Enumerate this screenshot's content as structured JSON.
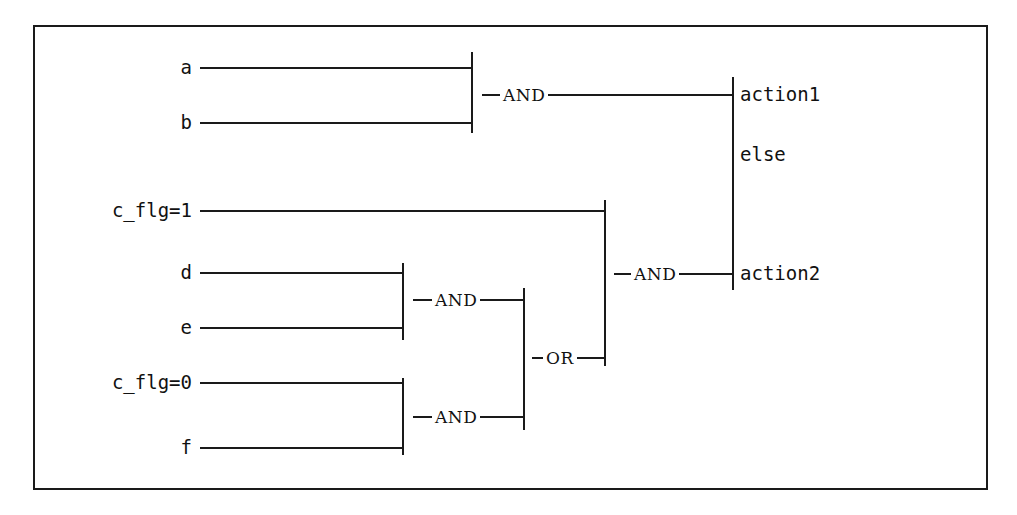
{
  "diagram": {
    "stroke_color": "#1a1a1a",
    "background_color": "#ffffff",
    "border": {
      "name": "diagram-frame",
      "x": 33,
      "y": 25,
      "width": 955,
      "height": 465,
      "thickness": 2
    },
    "inputs": [
      {
        "id": "a",
        "label": "a",
        "label_x": 192,
        "y": 68,
        "line_x1": 200,
        "line_x2": 472
      },
      {
        "id": "b",
        "label": "b",
        "label_x": 192,
        "y": 123,
        "line_x1": 200,
        "line_x2": 472
      },
      {
        "id": "c_flg1",
        "label": "c_flg=1",
        "label_x": 192,
        "y": 211,
        "line_x1": 200,
        "line_x2": 605
      },
      {
        "id": "d",
        "label": "d",
        "label_x": 192,
        "y": 273,
        "line_x1": 200,
        "line_x2": 403
      },
      {
        "id": "e",
        "label": "e",
        "label_x": 192,
        "y": 328,
        "line_x1": 200,
        "line_x2": 403
      },
      {
        "id": "c_flg0",
        "label": "c_flg=0",
        "label_x": 192,
        "y": 383,
        "line_x1": 200,
        "line_x2": 403
      },
      {
        "id": "f",
        "label": "f",
        "label_x": 192,
        "y": 448,
        "line_x1": 200,
        "line_x2": 403
      }
    ],
    "operators": [
      {
        "id": "and-ab",
        "label": "AND",
        "x": 521,
        "y": 95,
        "bracket_x": 472,
        "bracket_y1": 52,
        "bracket_y2": 133,
        "out_x1": 482,
        "out_x2": 733
      },
      {
        "id": "and-de",
        "label": "AND",
        "x": 453,
        "y": 300,
        "bracket_x": 403,
        "bracket_y1": 263,
        "bracket_y2": 340,
        "out_x1": 413,
        "out_x2": 524
      },
      {
        "id": "and-cf",
        "label": "AND",
        "x": 453,
        "y": 417,
        "bracket_x": 403,
        "bracket_y1": 378,
        "bracket_y2": 455,
        "out_x1": 413,
        "out_x2": 524
      },
      {
        "id": "or-mid",
        "label": "OR",
        "x": 557,
        "y": 358,
        "bracket_x": 524,
        "bracket_y1": 288,
        "bracket_y2": 430,
        "out_x1": 532,
        "out_x2": 605
      },
      {
        "id": "and-outer",
        "label": "AND",
        "x": 652,
        "y": 274,
        "bracket_x": 605,
        "bracket_y1": 200,
        "bracket_y2": 366,
        "out_x1": 614,
        "out_x2": 733
      }
    ],
    "outputs": [
      {
        "id": "action1",
        "label": "action1",
        "x": 740,
        "y": 95
      },
      {
        "id": "else",
        "label": "else",
        "x": 740,
        "y": 155
      },
      {
        "id": "action2",
        "label": "action2",
        "x": 740,
        "y": 274
      }
    ],
    "output_bracket": {
      "name": "output-bracket",
      "x": 733,
      "y1": 77,
      "y2": 290
    }
  }
}
